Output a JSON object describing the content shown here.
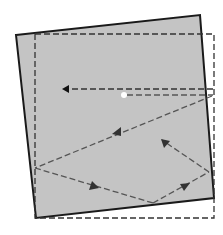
{
  "diagram": {
    "width": 223,
    "height": 235,
    "colors": {
      "background": "#ffffff",
      "square_fill": "#c4c4c4",
      "square_stroke": "#1a1a1a",
      "frame_stroke": "#333333",
      "path_stroke": "#555555",
      "arrow_fill": "#333333",
      "dot": "#ffffff"
    },
    "rotated_square": {
      "points": "16,35 200,15 214,198 36,218"
    },
    "dashed_frame": {
      "x": 35,
      "y": 34,
      "width": 179,
      "height": 184
    },
    "top_line": {
      "x1": 213,
      "y1": 89,
      "x2": 66,
      "y2": 89,
      "arrow_points": "62,89 69,85 69,93"
    },
    "dot": {
      "cx": 124,
      "cy": 95,
      "r": 3
    },
    "dot_line": {
      "x1": 127,
      "y1": 95,
      "x2": 213,
      "y2": 95
    },
    "segments": [
      {
        "x1": 212,
        "y1": 96,
        "x2": 35,
        "y2": 168
      },
      {
        "x1": 35,
        "y1": 168,
        "x2": 153,
        "y2": 203
      },
      {
        "x1": 153,
        "y1": 203,
        "x2": 209,
        "y2": 172
      },
      {
        "x1": 209,
        "y1": 172,
        "x2": 162,
        "y2": 140
      }
    ],
    "arrowheads": [
      {
        "points": "112,134 121,127 121,136"
      },
      {
        "points": "99,188 89,190 92,181"
      },
      {
        "points": "190,183 180,184 184,191"
      },
      {
        "points": "161,139 170,141 164,148"
      }
    ]
  }
}
